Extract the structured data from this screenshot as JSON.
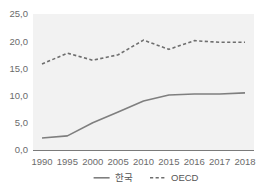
{
  "chart_data": {
    "type": "line",
    "title": "",
    "subtitle": "",
    "xlabel": "",
    "ylabel": "",
    "categories": [
      "1990",
      "1995",
      "2000",
      "2005",
      "2010",
      "2015",
      "2016",
      "2017",
      "2018"
    ],
    "series": [
      {
        "name": "한국",
        "style": "solid",
        "color": "#7f7f7f",
        "values": [
          2.2,
          2.6,
          5.0,
          7.0,
          9.0,
          10.1,
          10.3,
          10.3,
          10.5
        ]
      },
      {
        "name": "OECD",
        "style": "dashed",
        "color": "#6e6e6e",
        "values": [
          15.8,
          17.8,
          16.5,
          17.5,
          20.2,
          18.5,
          20.1,
          19.8,
          19.8
        ]
      }
    ],
    "ylim": [
      0.0,
      25.0
    ],
    "y_ticks": [
      0.0,
      5.0,
      10.0,
      15.0,
      20.0,
      25.0
    ],
    "y_tick_labels": [
      "0,0",
      "5,0",
      "10,0",
      "15,0",
      "20,0",
      "25,0"
    ],
    "grid": false,
    "legend_position": "bottom-center",
    "plot_background": "#f2f2f2"
  },
  "legend": {
    "entries": [
      {
        "label": "한국",
        "style": "solid"
      },
      {
        "label": "OECD",
        "style": "dashed"
      }
    ]
  }
}
